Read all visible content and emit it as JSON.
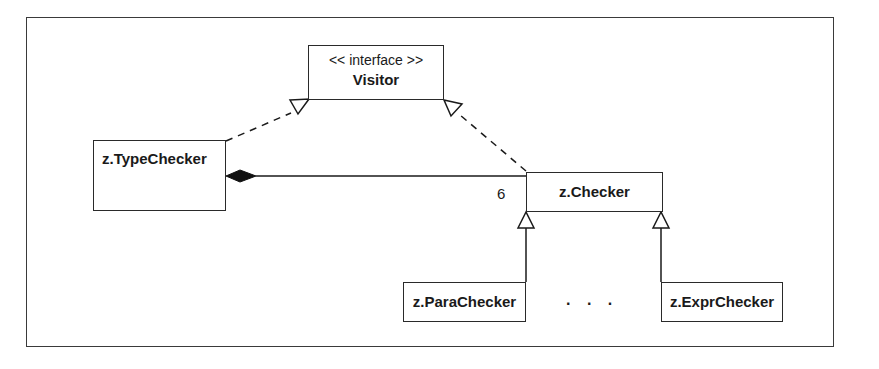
{
  "diagram": {
    "type": "UML class diagram",
    "classes": [
      {
        "id": "visitor",
        "stereotype": "<< interface >>",
        "name": "Visitor"
      },
      {
        "id": "typechecker",
        "name": "z.TypeChecker"
      },
      {
        "id": "checker",
        "name": "z.Checker"
      },
      {
        "id": "parachecker",
        "name": "z.ParaChecker"
      },
      {
        "id": "exprchecker",
        "name": "z.ExprChecker"
      }
    ],
    "relations": [
      {
        "from": "typechecker",
        "to": "visitor",
        "kind": "realization"
      },
      {
        "from": "checker",
        "to": "visitor",
        "kind": "realization"
      },
      {
        "from": "typechecker",
        "to": "checker",
        "kind": "composition",
        "multiplicity": "6"
      },
      {
        "from": "parachecker",
        "to": "checker",
        "kind": "generalization"
      },
      {
        "from": "exprchecker",
        "to": "checker",
        "kind": "generalization"
      }
    ],
    "multiplicity_label": "6",
    "ellipsis": ". . .",
    "colors": {
      "line": "#1a1a1a",
      "background": "#ffffff"
    }
  }
}
